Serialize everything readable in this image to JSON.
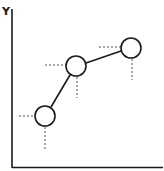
{
  "diagram": {
    "y_axis_label": "Y",
    "x_axis_label": "",
    "colors": {
      "stroke": "#1a1a1a",
      "dash": "#555555",
      "background": "#ffffff"
    },
    "points": [
      {
        "id": "p1",
        "cx": 45,
        "cy": 116,
        "r": 10
      },
      {
        "id": "p2",
        "cx": 76,
        "cy": 66,
        "r": 10
      },
      {
        "id": "p3",
        "cx": 131,
        "cy": 48,
        "r": 10
      }
    ],
    "guides": [
      {
        "point": "p1",
        "h_from_x": 19,
        "v_to_y": 150
      },
      {
        "point": "p2",
        "h_from_x": 45,
        "v_to_y": 98
      },
      {
        "point": "p3",
        "h_from_x": 99,
        "v_to_y": 80
      }
    ]
  }
}
